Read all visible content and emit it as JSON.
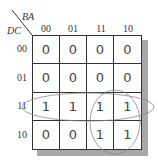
{
  "kmap": {
    "row_var": "DC",
    "col_var": "BA",
    "col_headers": [
      "00",
      "01",
      "11",
      "10"
    ],
    "row_headers": [
      "00",
      "01",
      "11",
      "10"
    ],
    "cells": [
      [
        "0",
        "0",
        "0",
        "0"
      ],
      [
        "0",
        "0",
        "0",
        "0"
      ],
      [
        "1",
        "1",
        "1",
        "1"
      ],
      [
        "0",
        "0",
        "1",
        "1"
      ]
    ],
    "groups": [
      {
        "name": "row-11-group",
        "cells": "DC=11, all BA"
      },
      {
        "name": "col-11-10-rows-11-10-group",
        "cells": "DC=11,10 × BA=11,10"
      }
    ]
  }
}
